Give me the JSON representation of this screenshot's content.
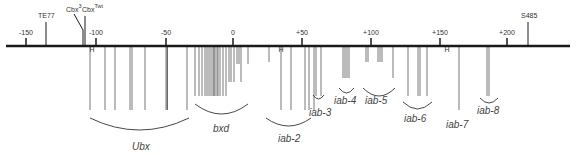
{
  "axis": {
    "y": 46,
    "x_start": 6,
    "x_end": 570,
    "ticks": [
      {
        "label": "-150",
        "x": 26
      },
      {
        "label": "-100",
        "x": 96
      },
      {
        "label": "-50",
        "x": 166
      },
      {
        "label": "0",
        "x": 233
      },
      {
        "label": "+50",
        "x": 302
      },
      {
        "label": "+100",
        "x": 371
      },
      {
        "label": "+150",
        "x": 440
      },
      {
        "label": "+200",
        "x": 507
      }
    ]
  },
  "markers": [
    {
      "label": "TE77",
      "x": 46,
      "label_x": 38,
      "top": 18
    },
    {
      "label": "Cbx",
      "sup": "3",
      "x": 83,
      "label_x": 66,
      "top": 12
    },
    {
      "label": "Cbx",
      "sup": "Twt",
      "x": 85,
      "label_x": 82,
      "top": 12
    },
    {
      "label": "S485",
      "x": 528,
      "label_x": 521,
      "top": 18
    }
  ],
  "h_sites": [
    {
      "label": "H",
      "x": 92
    },
    {
      "label": "H",
      "x": 281
    },
    {
      "label": "H",
      "x": 447
    }
  ],
  "breakpoints": [
    {
      "x": 90,
      "len": 64
    },
    {
      "x": 105,
      "len": 64
    },
    {
      "x": 115,
      "len": 64
    },
    {
      "x": 130,
      "len": 64
    },
    {
      "x": 132,
      "len": 64
    },
    {
      "x": 145,
      "len": 64
    },
    {
      "x": 166,
      "len": 64
    },
    {
      "x": 167,
      "len": 64
    },
    {
      "x": 167.5,
      "len": 64
    },
    {
      "x": 187,
      "len": 64
    },
    {
      "x": 195,
      "len": 50
    },
    {
      "x": 199,
      "len": 50
    },
    {
      "x": 202,
      "len": 50
    },
    {
      "x": 205,
      "len": 50
    },
    {
      "x": 207,
      "len": 50
    },
    {
      "x": 209,
      "len": 50
    },
    {
      "x": 211,
      "len": 50
    },
    {
      "x": 213,
      "len": 50
    },
    {
      "x": 214,
      "len": 50
    },
    {
      "x": 215,
      "len": 50
    },
    {
      "x": 217,
      "len": 50
    },
    {
      "x": 218,
      "len": 50
    },
    {
      "x": 220,
      "len": 50
    },
    {
      "x": 223,
      "len": 50
    },
    {
      "x": 226,
      "len": 50
    },
    {
      "x": 229,
      "len": 36
    },
    {
      "x": 231,
      "len": 36
    },
    {
      "x": 234,
      "len": 36
    },
    {
      "x": 237,
      "len": 18
    },
    {
      "x": 239,
      "len": 18
    },
    {
      "x": 241,
      "len": 36
    },
    {
      "x": 248,
      "len": 18
    },
    {
      "x": 269,
      "len": 16
    },
    {
      "x": 281,
      "len": 64
    },
    {
      "x": 291,
      "len": 64
    },
    {
      "x": 305,
      "len": 64
    },
    {
      "x": 309,
      "len": 64
    },
    {
      "x": 314,
      "len": 64
    },
    {
      "x": 316,
      "len": 50
    },
    {
      "x": 321,
      "len": 50
    },
    {
      "x": 343,
      "len": 32
    },
    {
      "x": 345,
      "len": 32
    },
    {
      "x": 347,
      "len": 32
    },
    {
      "x": 349,
      "len": 32
    },
    {
      "x": 366,
      "len": 16
    },
    {
      "x": 368,
      "len": 16
    },
    {
      "x": 378,
      "len": 16
    },
    {
      "x": 380,
      "len": 16
    },
    {
      "x": 382,
      "len": 16
    },
    {
      "x": 393,
      "len": 32
    },
    {
      "x": 408,
      "len": 50
    },
    {
      "x": 418,
      "len": 50
    },
    {
      "x": 420,
      "len": 50
    },
    {
      "x": 427,
      "len": 50
    },
    {
      "x": 459,
      "len": 64
    },
    {
      "x": 487,
      "len": 50
    },
    {
      "x": 489,
      "len": 50
    }
  ],
  "regions": [
    {
      "name": "Ubx",
      "x1": 90,
      "x2": 189,
      "arc_y": 118,
      "depth": 12,
      "label_x": 132,
      "label_y": 150
    },
    {
      "name": "bxd",
      "x1": 195,
      "x2": 248,
      "arc_y": 104,
      "depth": 10,
      "label_x": 213,
      "label_y": 132
    },
    {
      "name": "iab-2",
      "x1": 266,
      "x2": 311,
      "arc_y": 118,
      "depth": 8,
      "label_x": 278,
      "label_y": 142
    },
    {
      "name": "iab-3",
      "x1": 313,
      "x2": 324,
      "arc_y": 95,
      "depth": 4,
      "label_x": 309,
      "label_y": 116
    },
    {
      "name": "iab-4",
      "x1": 339,
      "x2": 354,
      "arc_y": 88,
      "depth": 5,
      "label_x": 334,
      "label_y": 104
    },
    {
      "name": "iab-5",
      "x1": 363,
      "x2": 395,
      "arc_y": 88,
      "depth": 8,
      "label_x": 365,
      "label_y": 104
    },
    {
      "name": "iab-6",
      "x1": 403,
      "x2": 432,
      "arc_y": 102,
      "depth": 7,
      "label_x": 404,
      "label_y": 122
    },
    {
      "name": "iab-7",
      "x1": 0,
      "x2": 0,
      "arc_y": 0,
      "depth": 0,
      "label_x": 446,
      "label_y": 128
    },
    {
      "name": "iab-8",
      "x1": 480,
      "x2": 498,
      "arc_y": 98,
      "depth": 5,
      "label_x": 477,
      "label_y": 114
    }
  ],
  "colors": {
    "axis": "#1a1a1a",
    "lines": "#555555",
    "arcs": "#333333",
    "text": "#333333"
  }
}
